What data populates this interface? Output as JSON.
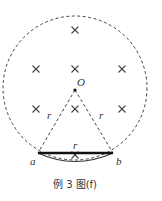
{
  "figure": {
    "caption": "例 3 图(f)",
    "colors": {
      "stroke": "#444444",
      "chord": "#111111",
      "text": "#333333"
    },
    "labels": {
      "center": "O",
      "point_a": "a",
      "point_b": "b",
      "radius_left": "r",
      "radius_right": "r",
      "chord": "r"
    },
    "field_symbol": "×",
    "field_marks": [
      {
        "x": 75,
        "y": 30
      },
      {
        "x": 36,
        "y": 69
      },
      {
        "x": 75,
        "y": 69
      },
      {
        "x": 122,
        "y": 69
      },
      {
        "x": 36,
        "y": 109
      },
      {
        "x": 75,
        "y": 109
      },
      {
        "x": 122,
        "y": 109
      },
      {
        "x": 75,
        "y": 155
      }
    ]
  }
}
